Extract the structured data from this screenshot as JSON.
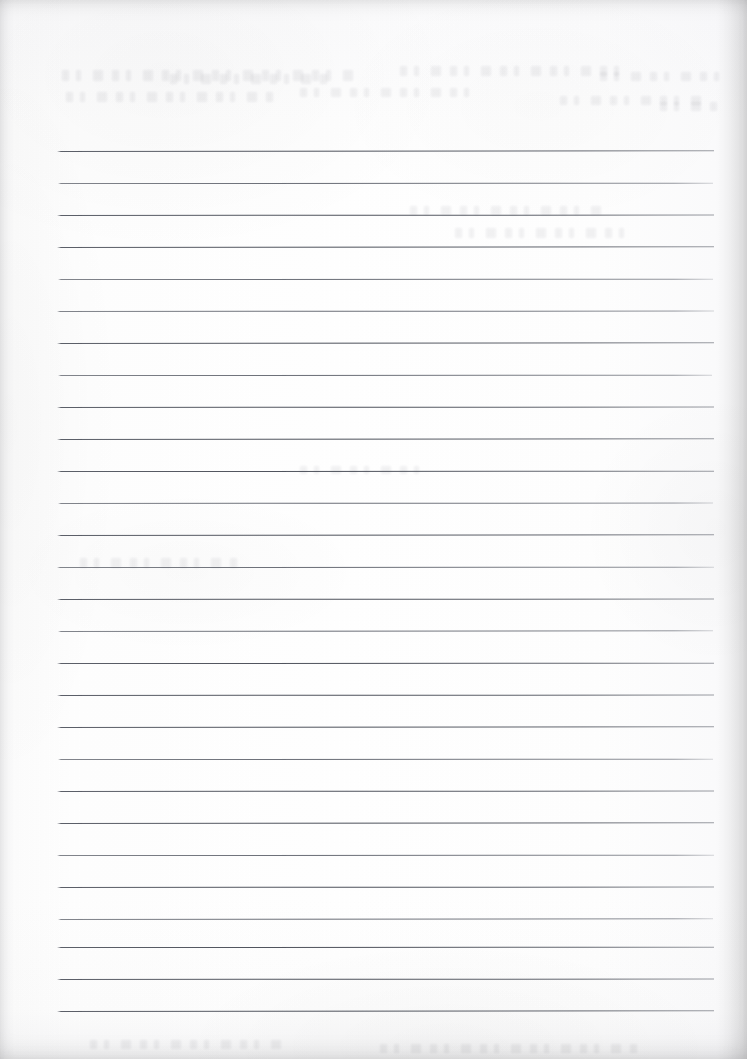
{
  "document": {
    "kind": "scanned-lined-paper",
    "title": "Blank lined notebook page",
    "page_width": 747,
    "page_height": 1059,
    "content_text": "",
    "is_blank": "true",
    "handwriting_present": "false"
  },
  "paper": {
    "background_color": "#fdfdfd",
    "tint_color": "#f6f6f7",
    "edge_shadow_color": "#e9e9ea",
    "texture": "scanner grain with soft mottling",
    "bleedthrough_note": "faint illegible ink ghosting near top of page"
  },
  "ruling": {
    "line_color": "#5c6069",
    "line_count": 28,
    "first_line_y": 151,
    "line_spacing": 31.9,
    "line_left_x": 57,
    "line_right_x": 714,
    "line_thickness": 1,
    "slope_note": "lines are very slightly tilted, left edge marginally lower than right",
    "lines": [
      {
        "y": 151,
        "x1": 57,
        "x2": 714,
        "weight": "heavy"
      },
      {
        "y": 183,
        "x1": 58,
        "x2": 713,
        "weight": "normal"
      },
      {
        "y": 215,
        "x1": 57,
        "x2": 714,
        "weight": "heavy"
      },
      {
        "y": 247,
        "x1": 57,
        "x2": 714,
        "weight": "heavy"
      },
      {
        "y": 279,
        "x1": 58,
        "x2": 713,
        "weight": "normal"
      },
      {
        "y": 311,
        "x1": 57,
        "x2": 714,
        "weight": "normal"
      },
      {
        "y": 343,
        "x1": 57,
        "x2": 714,
        "weight": "heavy"
      },
      {
        "y": 375,
        "x1": 58,
        "x2": 712,
        "weight": "normal"
      },
      {
        "y": 407,
        "x1": 57,
        "x2": 714,
        "weight": "heavy"
      },
      {
        "y": 439,
        "x1": 57,
        "x2": 714,
        "weight": "heavy"
      },
      {
        "y": 471,
        "x1": 57,
        "x2": 714,
        "weight": "heavy"
      },
      {
        "y": 503,
        "x1": 58,
        "x2": 713,
        "weight": "normal"
      },
      {
        "y": 535,
        "x1": 57,
        "x2": 714,
        "weight": "heavy"
      },
      {
        "y": 567,
        "x1": 57,
        "x2": 714,
        "weight": "normal"
      },
      {
        "y": 599,
        "x1": 57,
        "x2": 714,
        "weight": "heavy"
      },
      {
        "y": 631,
        "x1": 58,
        "x2": 713,
        "weight": "normal"
      },
      {
        "y": 663,
        "x1": 57,
        "x2": 714,
        "weight": "heavy"
      },
      {
        "y": 695,
        "x1": 57,
        "x2": 714,
        "weight": "heavy"
      },
      {
        "y": 727,
        "x1": 57,
        "x2": 714,
        "weight": "heavy"
      },
      {
        "y": 759,
        "x1": 58,
        "x2": 713,
        "weight": "normal"
      },
      {
        "y": 791,
        "x1": 57,
        "x2": 714,
        "weight": "heavy"
      },
      {
        "y": 823,
        "x1": 57,
        "x2": 714,
        "weight": "heavy"
      },
      {
        "y": 855,
        "x1": 57,
        "x2": 714,
        "weight": "normal"
      },
      {
        "y": 887,
        "x1": 57,
        "x2": 714,
        "weight": "heavy"
      },
      {
        "y": 919,
        "x1": 58,
        "x2": 713,
        "weight": "normal"
      },
      {
        "y": 947,
        "x1": 57,
        "x2": 714,
        "weight": "heavy"
      },
      {
        "y": 979,
        "x1": 57,
        "x2": 714,
        "weight": "heavy"
      },
      {
        "y": 1011,
        "x1": 57,
        "x2": 714,
        "weight": "heavy"
      }
    ]
  },
  "ghosting": {
    "rows": [
      {
        "x": 62,
        "y": 70,
        "w": 300,
        "h": 11
      },
      {
        "x": 170,
        "y": 74,
        "w": 160,
        "h": 10
      },
      {
        "x": 400,
        "y": 66,
        "w": 220,
        "h": 10
      },
      {
        "x": 600,
        "y": 72,
        "w": 120,
        "h": 9
      },
      {
        "x": 66,
        "y": 92,
        "w": 210,
        "h": 10
      },
      {
        "x": 300,
        "y": 88,
        "w": 180,
        "h": 9
      },
      {
        "x": 560,
        "y": 96,
        "w": 150,
        "h": 9
      },
      {
        "x": 660,
        "y": 102,
        "w": 60,
        "h": 9
      },
      {
        "x": 410,
        "y": 206,
        "w": 200,
        "h": 9
      },
      {
        "x": 455,
        "y": 228,
        "w": 180,
        "h": 10
      },
      {
        "x": 80,
        "y": 558,
        "w": 160,
        "h": 10
      },
      {
        "x": 300,
        "y": 466,
        "w": 120,
        "h": 8
      },
      {
        "x": 90,
        "y": 1040,
        "w": 200,
        "h": 9
      },
      {
        "x": 380,
        "y": 1044,
        "w": 260,
        "h": 9
      }
    ]
  }
}
